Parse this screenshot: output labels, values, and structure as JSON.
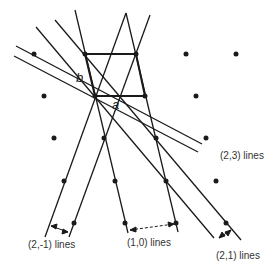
{
  "figure": {
    "point_labels": {
      "a": "a",
      "b": "b"
    },
    "line_labels": {
      "l_2_m1": "(2,-1) lines",
      "l_1_0": "(1,0) lines",
      "l_2_3": "(2,3) lines",
      "l_2_1": "(2,1) lines"
    },
    "lattice_points": [
      [
        34,
        54
      ],
      [
        85,
        54
      ],
      [
        136,
        54
      ],
      [
        186,
        54
      ],
      [
        236,
        54
      ],
      [
        44,
        96
      ],
      [
        95,
        96
      ],
      [
        145,
        96
      ],
      [
        196,
        96
      ],
      [
        54,
        138
      ],
      [
        104,
        138
      ],
      [
        156,
        138
      ],
      [
        206,
        138
      ],
      [
        64,
        181
      ],
      [
        115,
        181
      ],
      [
        166,
        181
      ],
      [
        216,
        181
      ],
      [
        74,
        223
      ],
      [
        125,
        223
      ],
      [
        176,
        223
      ],
      [
        226,
        223
      ]
    ],
    "colors": {
      "ink": "#1a1a1a",
      "background": "#ffffff"
    }
  }
}
